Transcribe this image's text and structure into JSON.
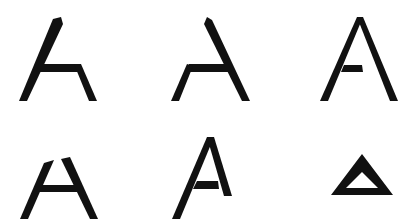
{
  "figure": {
    "ink_color": "#111111",
    "background_color": "#ffffff"
  },
  "glyphs": [
    {
      "id": 1,
      "label": "A variant: left diagonal with crossbar and right leg starting at crossbar",
      "row": 1,
      "col": 1
    },
    {
      "id": 2,
      "label": "A variant: right diagonal with crossbar and left leg starting at crossbar",
      "row": 1,
      "col": 2
    },
    {
      "id": 3,
      "label": "A variant: full A with short crossbar attached to left leg only",
      "row": 1,
      "col": 3
    },
    {
      "id": 4,
      "label": "A variant: two legs with broken apex and full crossbar",
      "row": 2,
      "col": 1
    },
    {
      "id": 5,
      "label": "A variant: F-like A with short right arm and crossbar",
      "row": 2,
      "col": 2
    },
    {
      "id": 6,
      "label": "A variant: closed triangle (delta) outline",
      "row": 2,
      "col": 3
    }
  ]
}
